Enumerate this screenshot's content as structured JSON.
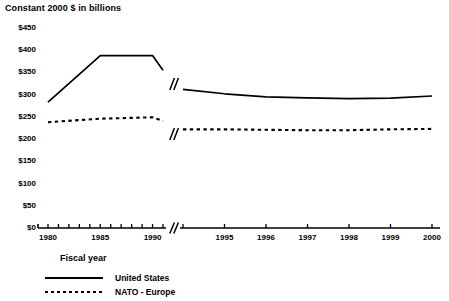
{
  "chart_data": {
    "type": "line",
    "title": "Constant 2000 $ in billions",
    "xlabel": "Fiscal year",
    "ylabel": "",
    "ylim": [
      0,
      450
    ],
    "ytick_labels": [
      "$450",
      "$400",
      "$350",
      "$300",
      "$250",
      "$200",
      "$150",
      "$100",
      "$50",
      "$0"
    ],
    "ytick_values": [
      450,
      400,
      350,
      300,
      250,
      200,
      150,
      100,
      50,
      0
    ],
    "xtick_labels": [
      "1980",
      "1985",
      "1990",
      "1995",
      "1996",
      "1997",
      "1998",
      "1999",
      "2000"
    ],
    "axis_break": true,
    "axis_break_note": "X axis broken between 1991 and 1994; Y scale continuous",
    "grid": false,
    "legend_position": "below-axis-left",
    "series": [
      {
        "name": "United States",
        "style": "solid",
        "color": "#000000",
        "x": [
          1980,
          1985,
          1990,
          1991,
          1994,
          1995,
          1996,
          1997,
          1998,
          1999,
          2000
        ],
        "values": [
          283,
          388,
          388,
          355,
          312,
          302,
          295,
          293,
          291,
          292,
          297
        ]
      },
      {
        "name": "NATO - Europe",
        "style": "dotted",
        "color": "#000000",
        "x": [
          1980,
          1985,
          1990,
          1991,
          1994,
          1995,
          1996,
          1997,
          1998,
          1999,
          2000
        ],
        "values": [
          238,
          246,
          249,
          241,
          222,
          222,
          221,
          220,
          220,
          222,
          223
        ]
      }
    ]
  },
  "legend": {
    "items": [
      {
        "label": "United States",
        "style": "solid"
      },
      {
        "label": "NATO - Europe",
        "style": "dotted"
      }
    ]
  }
}
